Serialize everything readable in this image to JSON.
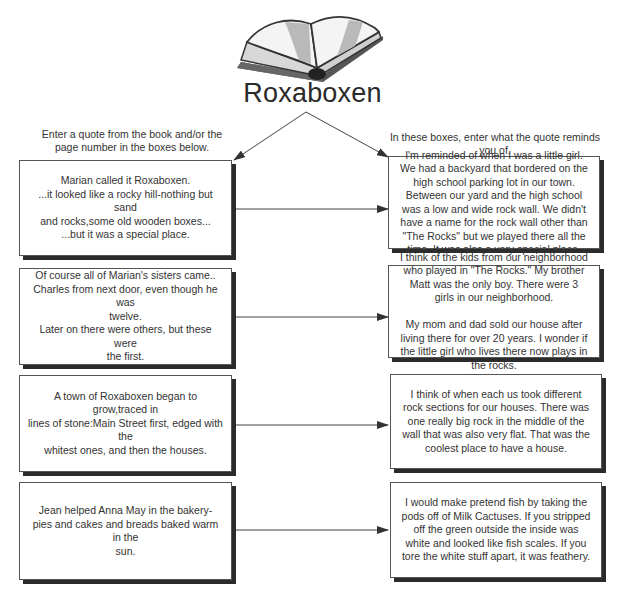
{
  "diagram": {
    "title": "Roxaboxen",
    "icon": "open-book-icon",
    "left_instruction": "Enter a quote from the book and/or the\npage number in the boxes below.",
    "right_instruction": "In these boxes, enter what the quote reminds\nyou of.",
    "rows": [
      {
        "quote": "Marian called it Roxaboxen.\n...it looked like a rocky hill-nothing but sand\nand rocks,some old wooden boxes...\n...but it was a special place.",
        "reminds": "I'm reminded of when I was a little girl. We had a backyard that bordered on the high school parking lot in our town. Between our yard and the high school was a low and wide rock wall. We didn't have a name for the rock wall other than \"The Rocks\"  but we played there all the time. It was also a very special place."
      },
      {
        "quote": "Of course all of Marian's sisters came..\nCharles from next door, even though he was\ntwelve.\nLater on there were others, but these were\nthe first.",
        "reminds": "I think of the kids from our neighborhood who played in \"The Rocks.\" My brother Matt was the only boy.  There were 3 girls in our neighborhood.\n\nMy mom and dad sold our house after living there for over 20 years. I wonder if the little girl who lives there now plays in the rocks."
      },
      {
        "quote": "A town of Roxaboxen began to grow,traced in\nlines of stone:Main Street first, edged with the\nwhitest ones, and then the houses.",
        "reminds": "I think of when each us took different rock sections for our houses.  There was one really big rock in the middle of the wall that was also very flat.  That was the coolest place to have a house."
      },
      {
        "quote": "Jean helped Anna May in the bakery-\npies and cakes and breads baked warm in the\nsun.",
        "reminds": "I would make pretend fish by taking the pods off of Milk Cactuses.  If you stripped off the green outside the inside was white and looked like fish scales. If you tore the white stuff apart, it was feathery."
      }
    ],
    "colors": {
      "line": "#444444",
      "shadow": "#2b2b2b",
      "border": "#555555",
      "text": "#333333"
    }
  }
}
